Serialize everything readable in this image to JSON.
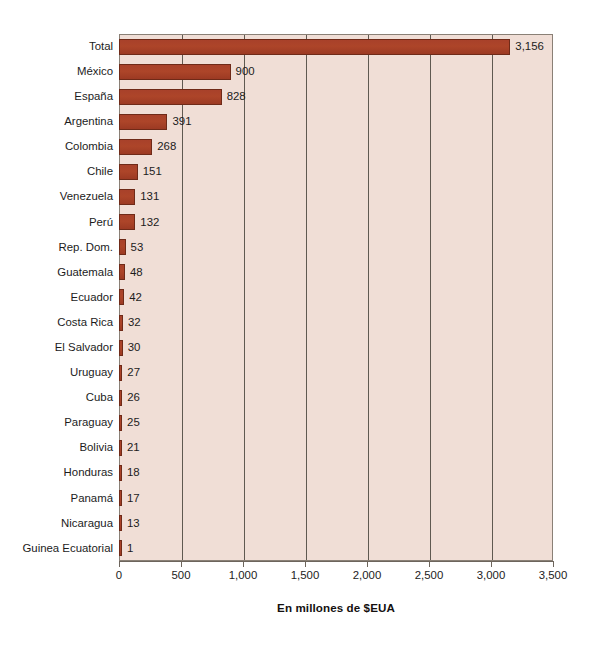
{
  "chart_data": {
    "type": "bar",
    "orientation": "horizontal",
    "title": "",
    "subtitle": "",
    "xlabel": "En millones de $EUA",
    "ylabel": "",
    "xlim": [
      0,
      3500
    ],
    "xticks": [
      0,
      500,
      1000,
      1500,
      2000,
      2500,
      3000,
      3500
    ],
    "xticklabels": [
      "0",
      "500",
      "1,000",
      "1,500",
      "2,000",
      "2,500",
      "3,000",
      "3,500"
    ],
    "grid": "vertical",
    "legend": "none",
    "categories": [
      "Total",
      "México",
      "España",
      "Argentina",
      "Colombia",
      "Chile",
      "Venezuela",
      "Perú",
      "Rep. Dom.",
      "Guatemala",
      "Ecuador",
      "Costa Rica",
      "El Salvador",
      "Uruguay",
      "Cuba",
      "Paraguay",
      "Bolivia",
      "Honduras",
      "Panamá",
      "Nicaragua",
      "Guinea Ecuatorial"
    ],
    "values": [
      3156,
      900,
      828,
      391,
      268,
      151,
      131,
      132,
      53,
      48,
      42,
      32,
      30,
      27,
      26,
      25,
      21,
      18,
      17,
      13,
      1
    ],
    "data_labels": [
      "3,156",
      "900",
      "828",
      "391",
      "268",
      "151",
      "131",
      "132",
      "53",
      "48",
      "42",
      "32",
      "30",
      "27",
      "26",
      "25",
      "21",
      "18",
      "17",
      "13",
      "1"
    ],
    "colors": {
      "bar_fill": "#a8412a",
      "bar_edge": "#6f2a18",
      "plot_background": "#f0ded6",
      "grid_line": "#5f5951",
      "axis_line": "#6d655c",
      "text": "#1c1c1c",
      "page_background": "#ffffff"
    }
  }
}
